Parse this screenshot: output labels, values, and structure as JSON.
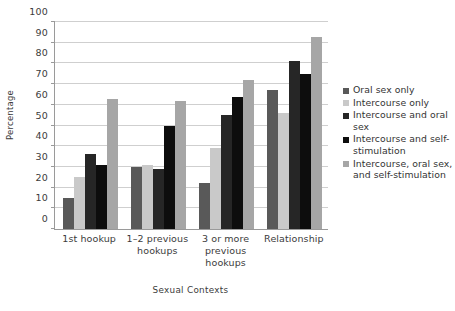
{
  "chart_data": {
    "type": "bar",
    "title": "",
    "xlabel": "Sexual Contexts",
    "ylabel": "Percentage",
    "ylim": [
      0,
      100
    ],
    "ytick_step": 10,
    "yticks": [
      0,
      10,
      20,
      30,
      40,
      50,
      60,
      70,
      80,
      90,
      100
    ],
    "grid": true,
    "legend_position": "right",
    "categories": [
      "1st hookup",
      "1–2 previous hookups",
      "3 or more previous hookups",
      "Relationship"
    ],
    "series": [
      {
        "name": "Oral sex only",
        "color": "#595959",
        "values": [
          15,
          30,
          22,
          67
        ]
      },
      {
        "name": "Intercourse only",
        "color": "#c9c9c9",
        "values": [
          25,
          31,
          39,
          56
        ]
      },
      {
        "name": "Intercourse and oral sex",
        "color": "#262626",
        "values": [
          36,
          29,
          55,
          81
        ]
      },
      {
        "name": "Intercourse and self-stimulation",
        "color": "#0d0d0d",
        "values": [
          31,
          50,
          64,
          75
        ]
      },
      {
        "name": "Intercourse, oral sex, and self-stimulation",
        "color": "#a6a6a6",
        "values": [
          63,
          62,
          72,
          93
        ]
      }
    ]
  }
}
